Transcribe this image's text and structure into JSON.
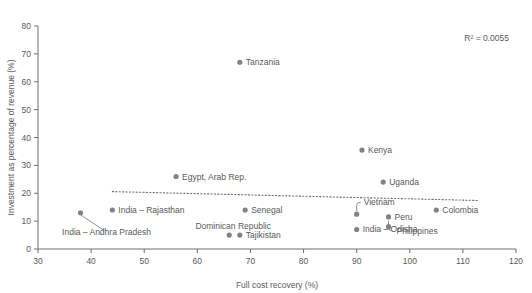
{
  "chart_data": {
    "type": "scatter",
    "title": "",
    "xlabel": "Full cost recovery (%)",
    "ylabel": "Investment as percentage of revenue (%)",
    "xlim": [
      30,
      120
    ],
    "ylim": [
      0,
      80
    ],
    "xticks": [
      "30",
      "40",
      "50",
      "60",
      "70",
      "80",
      "90",
      "100",
      "110",
      "120"
    ],
    "yticks": [
      "0",
      "10",
      "20",
      "30",
      "40",
      "50",
      "60",
      "70",
      "80"
    ],
    "grid": false,
    "legend": "none",
    "annotation": "R² = 0.0055",
    "trendline": {
      "style": "dotted",
      "x_start": 44,
      "y_start": 20.6,
      "x_end": 113,
      "y_end": 17.4
    },
    "points": [
      {
        "label": "Tanzania",
        "x": 68,
        "y": 67,
        "label_pos": "right"
      },
      {
        "label": "Kenya",
        "x": 91,
        "y": 35.5,
        "label_pos": "right"
      },
      {
        "label": "Egypt, Arab Rep.",
        "x": 56,
        "y": 26,
        "label_pos": "right"
      },
      {
        "label": "Uganda",
        "x": 95,
        "y": 24,
        "label_pos": "right"
      },
      {
        "label": "Senegal",
        "x": 69,
        "y": 14,
        "label_pos": "right"
      },
      {
        "label": "Colombia",
        "x": 105,
        "y": 14,
        "label_pos": "right"
      },
      {
        "label": "India – Rajasthan",
        "x": 44,
        "y": 14,
        "label_pos": "right"
      },
      {
        "label": "India – Andhra Pradesh",
        "x": 38,
        "y": 13,
        "label_pos": "leader-down-left"
      },
      {
        "label": "Vietnam",
        "x": 90,
        "y": 12.5,
        "label_pos": "leader-up-right"
      },
      {
        "label": "Peru",
        "x": 96,
        "y": 11.5,
        "label_pos": "right"
      },
      {
        "label": "Philippines",
        "x": 96,
        "y": 8,
        "label_pos": "leader-down-right"
      },
      {
        "label": "India – Odisha",
        "x": 90,
        "y": 7,
        "label_pos": "right"
      },
      {
        "label": "Dominican Republic",
        "x": 66,
        "y": 5,
        "label_pos": "above-left"
      },
      {
        "label": "Tajikistan",
        "x": 68,
        "y": 5,
        "label_pos": "right"
      }
    ]
  }
}
